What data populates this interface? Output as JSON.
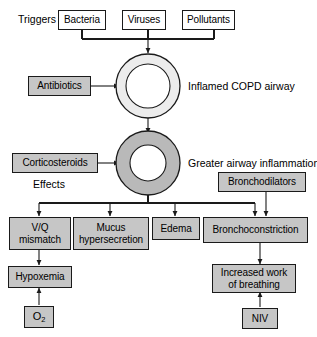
{
  "figure": {
    "colors": {
      "box_fill_treatment": "#c6c6c6",
      "box_fill_white": "#ffffff",
      "stroke": "#1a1a1a",
      "ring_inflamed_fill": "#ececec",
      "ring_greater_fill": "#b9b9b9"
    }
  },
  "labels": {
    "triggers": "Triggers",
    "effects": "Effects",
    "inflamed_airway": "Inflamed COPD airway",
    "greater_inflammation": "Greater airway inflammation"
  },
  "triggers": [
    {
      "id": "bacteria",
      "label": "Bacteria",
      "fill": "white"
    },
    {
      "id": "viruses",
      "label": "Viruses",
      "fill": "white"
    },
    {
      "id": "pollutants",
      "label": "Pollutants",
      "fill": "white"
    }
  ],
  "treatments": [
    {
      "id": "antibiotics",
      "label": "Antibiotics",
      "fill": "gray"
    },
    {
      "id": "corticosteroids",
      "label": "Corticosteroids",
      "fill": "gray"
    },
    {
      "id": "bronchodilators",
      "label": "Bronchodilators",
      "fill": "gray"
    },
    {
      "id": "oxygen",
      "label": "O",
      "sub": "2",
      "fill": "gray"
    },
    {
      "id": "niv",
      "label": "NIV",
      "fill": "gray"
    }
  ],
  "effects": [
    {
      "id": "vq-mismatch",
      "line1": "V/Q",
      "line2": "mismatch",
      "fill": "gray"
    },
    {
      "id": "mucus-hypersecretion",
      "line1": "Mucus",
      "line2": "hypersecretion",
      "fill": "gray"
    },
    {
      "id": "edema",
      "line1": "Edema",
      "line2": "",
      "fill": "gray"
    },
    {
      "id": "bronchoconstriction",
      "line1": "Bronchoconstriction",
      "line2": "",
      "fill": "gray"
    }
  ],
  "outcomes": [
    {
      "id": "hypoxemia",
      "line1": "Hypoxemia",
      "line2": "",
      "fill": "gray"
    },
    {
      "id": "increased-work-of-breathing",
      "line1": "Increased work",
      "line2": "of breathing",
      "fill": "gray"
    }
  ],
  "airways": [
    {
      "id": "airway-inflamed",
      "caption": "Inflamed COPD airway",
      "wall": "thin"
    },
    {
      "id": "airway-greater",
      "caption": "Greater airway inflammation",
      "wall": "thick"
    }
  ]
}
